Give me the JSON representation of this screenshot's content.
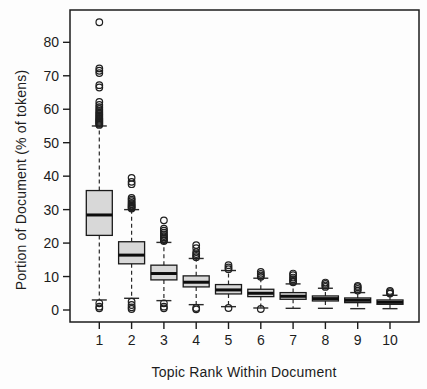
{
  "chart_data": {
    "type": "boxplot",
    "title": "",
    "xlabel": "Topic Rank Within Document",
    "ylabel": "Portion of Document (% of tokens)",
    "x_categories": [
      "1",
      "2",
      "3",
      "4",
      "5",
      "6",
      "7",
      "8",
      "9",
      "10"
    ],
    "y_ticks": [
      0,
      10,
      20,
      30,
      40,
      50,
      60,
      70,
      80
    ],
    "ylim": [
      -4,
      90
    ],
    "grid": false,
    "legend": "none",
    "boxes": [
      {
        "rank": "1",
        "whisker_low": 3.0,
        "q1": 22.3,
        "median": 28.4,
        "q3": 35.7,
        "whisker_high": 55.0,
        "outliers_low": [
          2.0,
          1.0,
          0.5
        ],
        "outliers_high": [
          55.3,
          55.6,
          55.9,
          56.2,
          56.5,
          56.8,
          57.1,
          57.4,
          57.8,
          58.2,
          58.6,
          59.0,
          59.5,
          60.0,
          60.6,
          61.3,
          62.2,
          66.5,
          67.2,
          70.8,
          71.5,
          72.2,
          86.0
        ]
      },
      {
        "rank": "2",
        "whisker_low": 3.5,
        "q1": 13.8,
        "median": 16.4,
        "q3": 20.4,
        "whisker_high": 30.0,
        "outliers_low": [
          2.5,
          1.5,
          0.8,
          0.3
        ],
        "outliers_high": [
          30.3,
          30.6,
          30.9,
          31.2,
          31.6,
          32.0,
          32.5,
          33.0,
          33.5,
          37.6,
          38.3,
          39.5
        ]
      },
      {
        "rank": "3",
        "whisker_low": 2.8,
        "q1": 9.0,
        "median": 10.9,
        "q3": 13.4,
        "whisker_high": 20.2,
        "outliers_low": [
          2.0,
          1.0,
          0.5
        ],
        "outliers_high": [
          20.6,
          20.9,
          21.3,
          21.7,
          22.1,
          22.6,
          23.1,
          23.7,
          24.3,
          26.8
        ]
      },
      {
        "rank": "4",
        "whisker_low": 1.6,
        "q1": 6.9,
        "median": 8.3,
        "q3": 10.2,
        "whisker_high": 15.4,
        "outliers_low": [
          0.6,
          0.2
        ],
        "outliers_high": [
          15.8,
          16.2,
          16.7,
          17.3,
          18.5,
          19.4
        ]
      },
      {
        "rank": "5",
        "whisker_low": 1.0,
        "q1": 4.8,
        "median": 6.0,
        "q3": 7.6,
        "whisker_high": 11.8,
        "outliers_low": [
          0.6
        ],
        "outliers_high": [
          12.2,
          12.7,
          13.4
        ]
      },
      {
        "rank": "6",
        "whisker_low": 0.6,
        "q1": 4.0,
        "median": 5.0,
        "q3": 6.2,
        "whisker_high": 9.5,
        "outliers_low": [
          0.3
        ],
        "outliers_high": [
          9.9,
          10.3,
          10.8,
          11.4
        ]
      },
      {
        "rank": "7",
        "whisker_low": 0.5,
        "q1": 3.2,
        "median": 4.1,
        "q3": 5.2,
        "whisker_high": 7.8,
        "outliers_low": [],
        "outliers_high": [
          8.3,
          8.7,
          9.2,
          9.7,
          10.4,
          10.9
        ]
      },
      {
        "rank": "8",
        "whisker_low": 0.5,
        "q1": 2.7,
        "median": 3.4,
        "q3": 4.2,
        "whisker_high": 6.5,
        "outliers_low": [],
        "outliers_high": [
          6.9,
          7.3,
          7.8,
          8.2
        ]
      },
      {
        "rank": "9",
        "whisker_low": 0.4,
        "q1": 2.2,
        "median": 2.9,
        "q3": 3.6,
        "whisker_high": 5.2,
        "outliers_low": [],
        "outliers_high": [
          5.8,
          6.3,
          6.8,
          7.2
        ]
      },
      {
        "rank": "10",
        "whisker_low": 0.4,
        "q1": 1.7,
        "median": 2.3,
        "q3": 3.0,
        "whisker_high": 4.4,
        "outliers_low": [],
        "outliers_high": [
          4.9,
          5.3,
          5.7
        ]
      }
    ],
    "colors": {
      "box_fill": "#d8d8d8",
      "box_border": "#1a1a1a",
      "median": "#0d0d0d",
      "whisker": "#2a2a2a",
      "outlier_stroke": "#1f1f1f",
      "axis": "#1c1c1c",
      "background": "#fdfdfd"
    }
  }
}
